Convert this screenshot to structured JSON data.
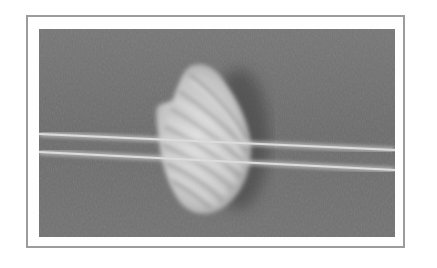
{
  "image": {
    "subject": "seashell with two strings across it",
    "style": "grayscale photograph",
    "colors": {
      "frame_border": "#9c9c9c",
      "frame_fill": "#fefefe",
      "background_surface": "#707070",
      "shell_light": "#d6d6d6",
      "shell_ridge": "#8a8a8a",
      "string": "#cfcfcf",
      "shadow": "#4a4a4a"
    }
  }
}
